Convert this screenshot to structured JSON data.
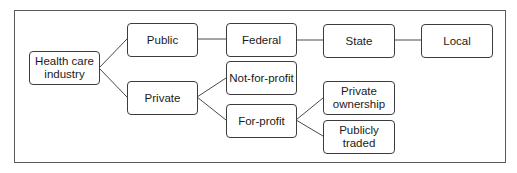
{
  "diagram": {
    "type": "tree",
    "nodes": {
      "root": {
        "label": "Health care industry",
        "line1": "Health care",
        "line2": "industry"
      },
      "public": {
        "label": "Public"
      },
      "private": {
        "label": "Private"
      },
      "federal": {
        "label": "Federal"
      },
      "state": {
        "label": "State"
      },
      "local": {
        "label": "Local"
      },
      "not_for_profit": {
        "label": "Not-for-profit"
      },
      "for_profit": {
        "label": "For-profit"
      },
      "private_ownership": {
        "label": "Private ownership",
        "line1": "Private",
        "line2": "ownership"
      },
      "publicly_traded": {
        "label": "Publicly traded",
        "line1": "Publicly",
        "line2": "traded"
      }
    },
    "edges": [
      [
        "Health care industry",
        "Public"
      ],
      [
        "Health care industry",
        "Private"
      ],
      [
        "Public",
        "Federal"
      ],
      [
        "Federal",
        "State"
      ],
      [
        "State",
        "Local"
      ],
      [
        "Private",
        "Not-for-profit"
      ],
      [
        "Private",
        "For-profit"
      ],
      [
        "For-profit",
        "Private ownership"
      ],
      [
        "For-profit",
        "Publicly traded"
      ]
    ],
    "colors": {
      "border": "#3c3c3c",
      "line": "#4a4a4a",
      "background": "#ffffff",
      "text": "#1a1a1a"
    }
  }
}
